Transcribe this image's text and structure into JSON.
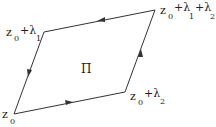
{
  "diagram": {
    "region_label": "Π",
    "vertices": {
      "z0": {
        "x": 14,
        "y": 114
      },
      "z0_l1": {
        "x": 44,
        "y": 32
      },
      "z0_l1_l2": {
        "x": 155,
        "y": 10
      },
      "z0_l2": {
        "x": 125,
        "y": 92
      }
    },
    "labels": {
      "z0": {
        "base": "z",
        "sub": "0"
      },
      "z0_l1": {
        "base": "z",
        "sub": "0",
        "plus1": "+λ",
        "sub1": "1"
      },
      "z0_l2": {
        "base": "z",
        "sub": "0",
        "plus1": "+λ",
        "sub1": "2"
      },
      "z0_l1_l2": {
        "base": "z",
        "sub": "0",
        "plus1": "+λ",
        "sub1": "1",
        "plus2": "+λ",
        "sub2": "2"
      }
    },
    "edge_color": "#333333"
  }
}
